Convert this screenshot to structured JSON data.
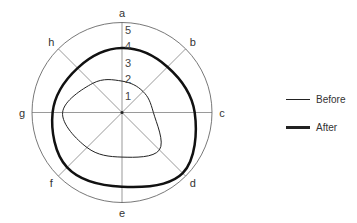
{
  "chart_data": {
    "type": "radar",
    "title": "",
    "categories": [
      "a",
      "b",
      "c",
      "d",
      "e",
      "f",
      "g",
      "h"
    ],
    "radial_ticks": [
      1,
      2,
      3,
      4,
      5
    ],
    "rmax": 5.45,
    "series": [
      {
        "name": "Before",
        "values": [
          1.9,
          1.8,
          1.9,
          3.2,
          2.7,
          3.0,
          3.6,
          2.5
        ],
        "stroke": "#222222",
        "width": 1
      },
      {
        "name": "After",
        "values": [
          3.9,
          3.9,
          4.4,
          5.2,
          4.5,
          4.7,
          4.2,
          3.8
        ],
        "stroke": "#111111",
        "width": 2.5
      }
    ],
    "legend_position": "right",
    "grid": "spokes + outer circle"
  },
  "legend": {
    "items": [
      {
        "label": "Before"
      },
      {
        "label": "After"
      }
    ]
  }
}
